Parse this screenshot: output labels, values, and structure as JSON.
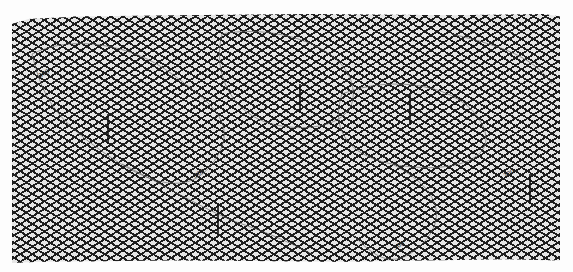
{
  "figure": {
    "type": "3d-wireframe-surface",
    "colors": {
      "background": "#fdfdfd",
      "mesh_line": "#1e1e1e",
      "mesh_fill": "#e6e6e6",
      "contour": "#555555"
    },
    "markers": [
      {
        "id": "m1",
        "label": "300",
        "x": 108,
        "y": 130
      },
      {
        "id": "m2",
        "label": "300",
        "x": 300,
        "y": 100
      },
      {
        "id": "m3",
        "label": "300",
        "x": 410,
        "y": 110
      },
      {
        "id": "m4",
        "label": "300",
        "x": 218,
        "y": 222
      },
      {
        "id": "m5",
        "label": "300",
        "x": 530,
        "y": 190
      }
    ],
    "contour_labels": [
      {
        "text": "300",
        "x": 40,
        "y": 78
      },
      {
        "text": "300",
        "x": 195,
        "y": 178
      },
      {
        "text": "300",
        "x": 395,
        "y": 250
      },
      {
        "text": "300",
        "x": 505,
        "y": 178
      }
    ]
  }
}
